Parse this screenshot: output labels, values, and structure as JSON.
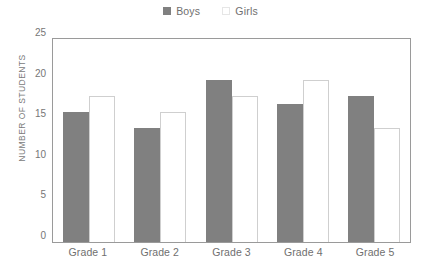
{
  "chart_data": {
    "type": "bar",
    "title": "",
    "xlabel": "",
    "ylabel": "NUMBER OF STUDENTS",
    "categories": [
      "Grade 1",
      "Grade 2",
      "Grade 3",
      "Grade 4",
      "Grade 5"
    ],
    "series": [
      {
        "name": "Boys",
        "values": [
          16,
          14,
          20,
          17,
          18
        ],
        "color": "#808080"
      },
      {
        "name": "Girls",
        "values": [
          18,
          16,
          18,
          20,
          14
        ],
        "color": "#ffffff"
      }
    ],
    "ylim": [
      0,
      25
    ],
    "y_ticks": [
      0,
      5,
      10,
      15,
      20,
      25
    ],
    "grid": false,
    "legend_position": "top-center"
  },
  "legend": {
    "entries": [
      {
        "label": "Boys",
        "swatch": "filled-gray-square"
      },
      {
        "label": "Girls",
        "swatch": "outlined-white-square"
      }
    ]
  },
  "axes": {
    "y_title": "NUMBER OF STUDENTS",
    "y_tick_labels": [
      "25",
      "20",
      "15",
      "10",
      "5",
      "0"
    ],
    "x_tick_labels": [
      "Grade 1",
      "Grade 2",
      "Grade 3",
      "Grade 4",
      "Grade 5"
    ]
  },
  "colors": {
    "boys_bar": "#808080",
    "girls_bar": "#ffffff",
    "girls_bar_border": "#cfcfcf",
    "plot_border": "#9a9a9a",
    "text": "#6f6f6f"
  }
}
